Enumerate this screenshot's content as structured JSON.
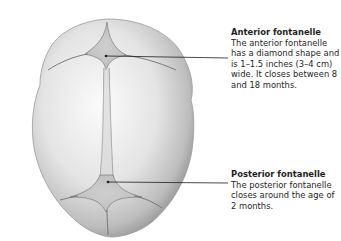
{
  "diagram": {
    "callouts": [
      {
        "title": "Anterior fontanelle",
        "body": "The anterior fontanelle has a diamond shape and is 1–1.5 inches (3–4 cm) wide. It closes between 8 and 18 months."
      },
      {
        "title": "Posterior fontanelle",
        "body": "The posterior fontanelle closes around the age of 2 months."
      }
    ],
    "colors": {
      "background": "#ffffff",
      "skull_light": "#f2f2f2",
      "skull_dark": "#a9a9a9",
      "suture": "#6e6e6e",
      "leader_line": "#1e1e1e",
      "text": "#1e1e1e"
    }
  }
}
